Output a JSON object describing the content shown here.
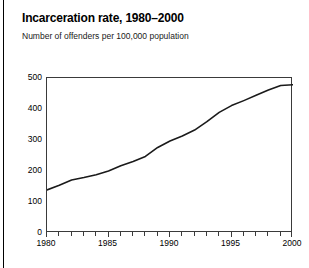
{
  "chart_data": {
    "type": "line",
    "title": "Incarceration rate, 1980–2000",
    "subtitle": "Number of offenders per 100,000 population",
    "xlabel": "",
    "ylabel": "",
    "xlim": [
      1980,
      2000
    ],
    "ylim": [
      0,
      500
    ],
    "grid": false,
    "legend": false,
    "legend_position": "none",
    "line_color": "#1a1a1a",
    "x": [
      1980,
      1981,
      1982,
      1983,
      1984,
      1985,
      1986,
      1987,
      1988,
      1989,
      1990,
      1991,
      1992,
      1993,
      1994,
      1995,
      1996,
      1997,
      1998,
      1999,
      2000
    ],
    "series": [
      {
        "name": "Incarceration rate",
        "values": [
          139,
          154,
          171,
          179,
          188,
          200,
          217,
          231,
          247,
          276,
          297,
          313,
          332,
          359,
          389,
          411,
          427,
          444,
          461,
          476,
          478
        ]
      }
    ],
    "y_ticks": [
      0,
      100,
      200,
      300,
      400,
      500
    ],
    "y_tick_labels": [
      "0",
      "100",
      "200",
      "300",
      "400",
      "500"
    ],
    "x_ticks": [
      1980,
      1981,
      1982,
      1983,
      1984,
      1985,
      1986,
      1987,
      1988,
      1989,
      1990,
      1991,
      1992,
      1993,
      1994,
      1995,
      1996,
      1997,
      1998,
      1999,
      2000
    ],
    "x_tick_labels_shown": [
      "1980",
      "1985",
      "1990",
      "1995",
      "2000"
    ],
    "x_label_years": [
      1980,
      1985,
      1990,
      1995,
      2000
    ]
  }
}
